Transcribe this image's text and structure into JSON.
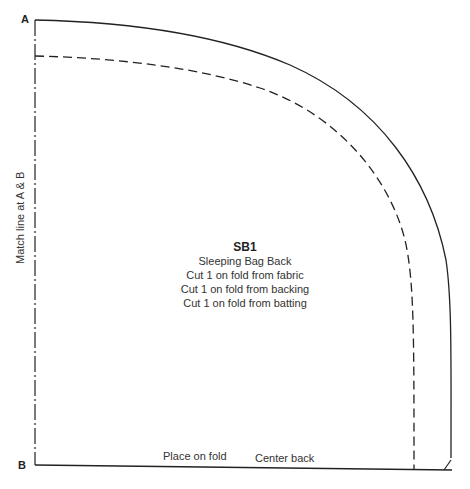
{
  "pattern": {
    "piece_code": "SB1",
    "piece_name": "Sleeping Bag Back",
    "instructions": [
      "Cut 1 on fold from fabric",
      "Cut 1 on fold from backing",
      "Cut 1 on fold from batting"
    ],
    "corner_labels": {
      "top": "A",
      "bottom": "B"
    },
    "side_label": "Match line at A & B",
    "bottom_labels": {
      "fold": "Place on fold",
      "center": "Center back"
    },
    "colors": {
      "line": "#222222",
      "background": "#ffffff"
    }
  }
}
